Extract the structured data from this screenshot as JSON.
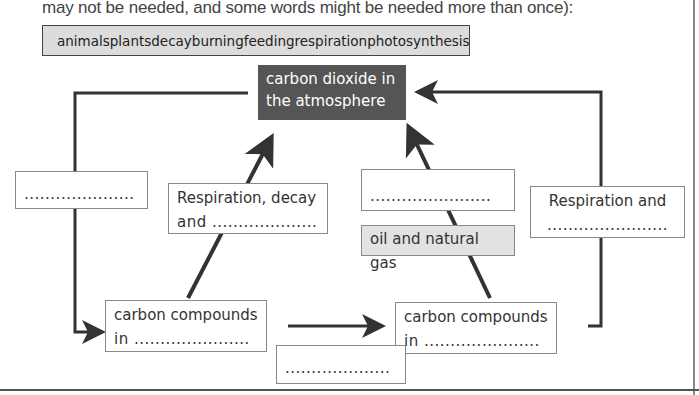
{
  "instructions": {
    "text": "may not be needed, and some words might be needed more than once):"
  },
  "word_bank": [
    "animals",
    "plants",
    "decay",
    "burning",
    "feeding",
    "respiration",
    "photosynthesis"
  ],
  "diagram": {
    "atmosphere": {
      "line1": "carbon dioxide in",
      "line2": "the atmosphere"
    },
    "left_blank": {
      "line1": "",
      "line2": "....................."
    },
    "resp_decay": {
      "line1": "Respiration, decay",
      "line2": "and ...................."
    },
    "middle_right_blank": {
      "line1": "",
      "line2": "......................."
    },
    "fossil": {
      "label": "oil and natural gas"
    },
    "resp_and": {
      "line1": "Respiration and",
      "line2": "......................."
    },
    "compounds_left": {
      "line1": "carbon compounds",
      "line2": "in ......................"
    },
    "compounds_right": {
      "line1": "carbon compounds",
      "line2": "in ......................"
    },
    "bottom_blank": {
      "line1": "",
      "line2": "...................."
    }
  }
}
